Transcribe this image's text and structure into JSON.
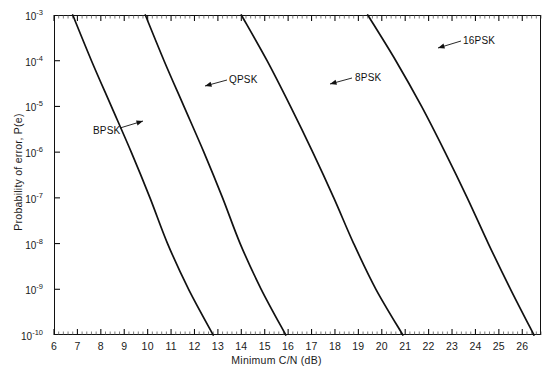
{
  "chart_data": {
    "type": "line",
    "title": "",
    "xlabel": "Minimum C/N (dB)",
    "ylabel": "Probability of error, P(e)",
    "xlim": [
      6,
      26.8
    ],
    "ylim": [
      1e-10,
      0.001
    ],
    "yscale": "log",
    "grid": false,
    "legend_position": "inline-annotations",
    "xticks": [
      6,
      7,
      8,
      9,
      10,
      11,
      12,
      13,
      14,
      15,
      16,
      17,
      18,
      19,
      20,
      21,
      22,
      23,
      24,
      25,
      26
    ],
    "xtick_labels": [
      "6",
      "7",
      "8",
      "9",
      "10",
      "11",
      "12",
      "13",
      "14",
      "15",
      "16",
      "17",
      "18",
      "19",
      "20",
      "21",
      "22",
      "23",
      "24",
      "25",
      "26"
    ],
    "xminor_step": 0.2,
    "yticks": [
      0.001,
      0.0001,
      1e-05,
      1e-06,
      1e-07,
      1e-08,
      1e-09,
      1e-10
    ],
    "ytick_labels": [
      "10-3",
      "10-4",
      "10-5",
      "10-6",
      "10-7",
      "10-8",
      "10-9",
      "10-10"
    ],
    "ytick_mantissa": "10",
    "ytick_exponents": [
      "-3",
      "-4",
      "-5",
      "-6",
      "-7",
      "-8",
      "-9",
      "-10"
    ],
    "series": [
      {
        "name": "BPSK",
        "label": "BPSK",
        "color": "#111111",
        "points": [
          {
            "x": 6.8,
            "y": 0.001
          },
          {
            "x": 7.6,
            "y": 0.0001
          },
          {
            "x": 8.45,
            "y": 1e-05
          },
          {
            "x": 9.3,
            "y": 1e-06
          },
          {
            "x": 10.1,
            "y": 1e-07
          },
          {
            "x": 10.85,
            "y": 1e-08
          },
          {
            "x": 11.75,
            "y": 1e-09
          },
          {
            "x": 12.8,
            "y": 1e-10
          }
        ]
      },
      {
        "name": "QPSK",
        "label": "QPSK",
        "color": "#111111",
        "points": [
          {
            "x": 9.9,
            "y": 0.001
          },
          {
            "x": 10.7,
            "y": 0.0001
          },
          {
            "x": 11.55,
            "y": 1e-05
          },
          {
            "x": 12.4,
            "y": 1e-06
          },
          {
            "x": 13.2,
            "y": 1e-07
          },
          {
            "x": 13.95,
            "y": 1e-08
          },
          {
            "x": 14.85,
            "y": 1e-09
          },
          {
            "x": 15.9,
            "y": 1e-10
          }
        ]
      },
      {
        "name": "8PSK",
        "label": "8PSK",
        "color": "#111111",
        "points": [
          {
            "x": 14.0,
            "y": 0.001
          },
          {
            "x": 15.1,
            "y": 0.0001
          },
          {
            "x": 16.1,
            "y": 1e-05
          },
          {
            "x": 17.05,
            "y": 1e-06
          },
          {
            "x": 17.95,
            "y": 1e-07
          },
          {
            "x": 18.8,
            "y": 1e-08
          },
          {
            "x": 19.75,
            "y": 1e-09
          },
          {
            "x": 20.9,
            "y": 1e-10
          }
        ]
      },
      {
        "name": "16PSK",
        "label": "16PSK",
        "color": "#111111",
        "points": [
          {
            "x": 19.4,
            "y": 0.001
          },
          {
            "x": 20.6,
            "y": 0.0001
          },
          {
            "x": 21.7,
            "y": 1e-05
          },
          {
            "x": 22.7,
            "y": 1e-06
          },
          {
            "x": 23.65,
            "y": 1e-07
          },
          {
            "x": 24.55,
            "y": 1e-08
          },
          {
            "x": 25.5,
            "y": 1e-09
          },
          {
            "x": 26.5,
            "y": 1e-10
          }
        ]
      }
    ],
    "annotations": [
      {
        "text": "BPSK",
        "label_x": 93,
        "label_y": 131,
        "arrow_from_x": 120,
        "arrow_from_y": 128,
        "arrow_to_x": 143,
        "arrow_to_y": 121,
        "direction": "right"
      },
      {
        "text": "QPSK",
        "label_x": 229,
        "label_y": 80,
        "arrow_from_x": 227,
        "arrow_from_y": 80,
        "arrow_to_x": 205,
        "arrow_to_y": 86,
        "direction": "left"
      },
      {
        "text": "8PSK",
        "label_x": 355,
        "label_y": 78,
        "arrow_from_x": 352,
        "arrow_from_y": 78,
        "arrow_to_x": 330,
        "arrow_to_y": 84,
        "direction": "left"
      },
      {
        "text": "16PSK",
        "label_x": 463,
        "label_y": 41,
        "arrow_from_x": 461,
        "arrow_from_y": 41,
        "arrow_to_x": 438,
        "arrow_to_y": 48,
        "direction": "left"
      }
    ]
  }
}
